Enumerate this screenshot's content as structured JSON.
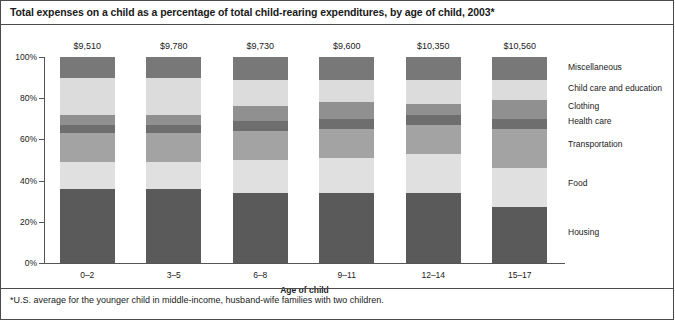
{
  "title": "Total expenses on a child as a percentage of total child-rearing expenditures, by age of child, 2003*",
  "footnote": "*U.S. average for the younger child in middle-income, husband-wife families with two children.",
  "chart_data": {
    "type": "bar",
    "subtype": "stacked-percent",
    "title": "Total expenses on a child as a percentage of total child-rearing expenditures, by age of child, 2003*",
    "xlabel": "Age of child",
    "ylabel": "",
    "ylim": [
      0,
      100
    ],
    "ytick_labels": [
      "0%",
      "20%",
      "40%",
      "60%",
      "80%",
      "100%"
    ],
    "ytick_values": [
      0,
      20,
      40,
      60,
      80,
      100
    ],
    "grid": false,
    "legend_position": "right",
    "categories": [
      "0–2",
      "3–5",
      "6–8",
      "9–11",
      "12–14",
      "15–17"
    ],
    "bar_totals": [
      "$9,510",
      "$9,780",
      "$9,730",
      "$9,600",
      "$10,350",
      "$10,560"
    ],
    "series": [
      {
        "name": "Housing",
        "color": "#5a5a5a",
        "values": [
          36,
          36,
          34,
          34,
          34,
          27
        ]
      },
      {
        "name": "Food",
        "color": "#e0e0e0",
        "values": [
          13,
          13,
          16,
          17,
          19,
          19
        ]
      },
      {
        "name": "Transportation",
        "color": "#a3a3a3",
        "values": [
          14,
          14,
          14,
          14,
          14,
          19
        ]
      },
      {
        "name": "Health care",
        "color": "#6e6e6e",
        "values": [
          4,
          4,
          5,
          5,
          5,
          5
        ]
      },
      {
        "name": "Clothing",
        "color": "#909090",
        "values": [
          5,
          5,
          7,
          8,
          5,
          9
        ]
      },
      {
        "name": "Child care and education",
        "color": "#dcdcdc",
        "values": [
          18,
          18,
          13,
          11,
          12,
          10
        ]
      },
      {
        "name": "Miscellaneous",
        "color": "#787878",
        "values": [
          10,
          10,
          11,
          11,
          11,
          11
        ]
      }
    ],
    "legend_entries": [
      {
        "label": "Miscellaneous",
        "y_pct": 95
      },
      {
        "label": "Child care and education",
        "y_pct": 85
      },
      {
        "label": "Clothing",
        "y_pct": 76
      },
      {
        "label": "Health care",
        "y_pct": 69
      },
      {
        "label": "Transportation",
        "y_pct": 58
      },
      {
        "label": "Food",
        "y_pct": 39
      },
      {
        "label": "Housing",
        "y_pct": 15
      }
    ]
  }
}
